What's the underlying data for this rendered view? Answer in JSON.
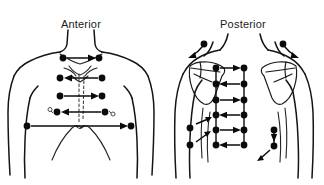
{
  "figure": {
    "kind": "anatomical-diagram",
    "background_color": "#ffffff",
    "ink_color": "#0b0b0b"
  },
  "panels": [
    {
      "id": "anterior",
      "title": "Anterior",
      "marker_legend": "solid-dot-site",
      "site_rows": [
        {
          "row": 1,
          "y": 58,
          "x_positions": [
            63,
            99
          ],
          "arrow": "right"
        },
        {
          "row": 2,
          "y": 78,
          "x_positions": [
            60,
            102
          ],
          "arrow": "left"
        },
        {
          "row": 3,
          "y": 96,
          "x_positions": [
            60,
            102
          ],
          "arrow": "right"
        },
        {
          "row": 4,
          "y": 112,
          "x_positions": [
            57,
            105
          ],
          "arrow": "left"
        },
        {
          "row": 5,
          "y": 126,
          "x_positions": [
            27,
            131
          ],
          "arrow": "right"
        }
      ],
      "open_marks": [
        {
          "x": 50,
          "y": 109
        },
        {
          "x": 113,
          "y": 114
        }
      ],
      "midline": "dashed-sternum"
    },
    {
      "id": "posterior",
      "title": "Posterior",
      "marker_legend": "solid-dot-site",
      "shoulder_sites": [
        {
          "x": 42,
          "y": 44,
          "arrow": "down-left-curve"
        },
        {
          "x": 121,
          "y": 44,
          "arrow": "down-right-curve"
        }
      ],
      "site_rows": [
        {
          "row": 1,
          "y": 68,
          "x_positions": [
            54,
            82
          ],
          "arrow": "right"
        },
        {
          "row": 2,
          "y": 84,
          "x_positions": [
            54,
            82
          ],
          "arrow": "left"
        },
        {
          "row": 3,
          "y": 100,
          "x_positions": [
            54,
            82
          ],
          "arrow": "right"
        },
        {
          "row": 4,
          "y": 115,
          "x_positions": [
            54,
            82
          ],
          "arrow": "left"
        },
        {
          "row": 5,
          "y": 130,
          "x_positions": [
            54,
            82
          ],
          "arrow": "right"
        },
        {
          "row": 6,
          "y": 145,
          "x_positions": [
            54,
            82
          ],
          "arrow": "left"
        }
      ],
      "lateral_sites": [
        {
          "x": 28,
          "y": 128,
          "arrow": "up-right-diagonal"
        },
        {
          "x": 28,
          "y": 145,
          "arrow": "up-right-diagonal"
        },
        {
          "x": 112,
          "y": 130,
          "arrow": "down"
        },
        {
          "x": 112,
          "y": 146,
          "arrow": "up-left-diagonal"
        }
      ],
      "bones": [
        "left-scapula",
        "right-scapula"
      ],
      "vertical_connectors": true
    }
  ],
  "icons": {
    "dot": "site-dot-icon",
    "arrow_right": "arrow-right-icon",
    "arrow_left": "arrow-left-icon",
    "arrow_down": "arrow-down-icon",
    "arrow_diagonal": "arrow-diagonal-icon"
  }
}
